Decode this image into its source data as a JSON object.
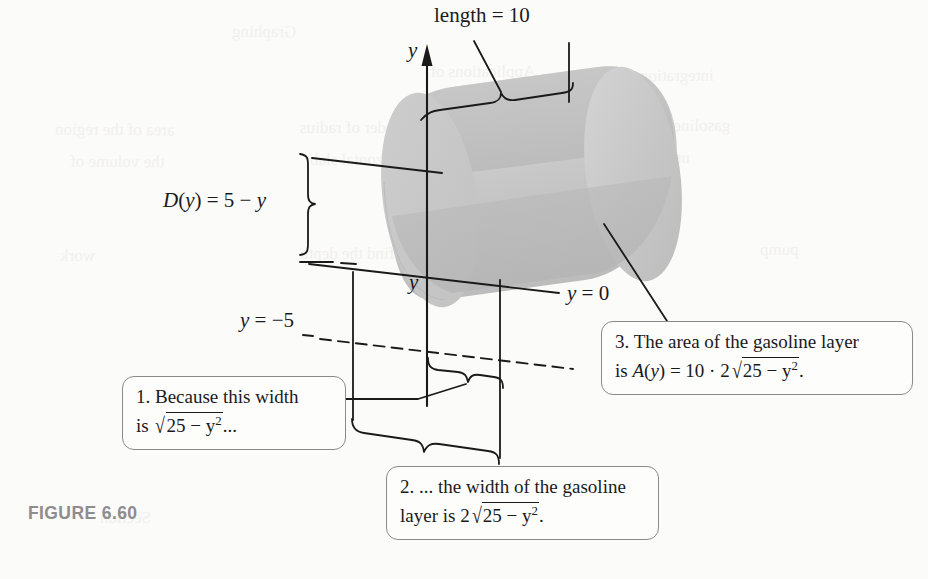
{
  "figure": {
    "caption": "FIGURE 6.60",
    "background_color": "#fbfbfa",
    "ink_color": "#1a1a1a",
    "caption_color": "#8d8d8d",
    "cylinder_body_color": "#c9c9c9",
    "cylinder_shadow_color": "#b0b0b0",
    "cylinder_highlight_color": "#d8d8d8",
    "callout_border_color": "#8a8a8a"
  },
  "labels": {
    "length": "length = 10",
    "axis_y": "y",
    "depth_function": "D(y) = 5 − y",
    "slab_y": "y",
    "y_zero": "y = 0",
    "y_minus_five": "y = −5"
  },
  "label_parts": {
    "length_text": "length = 10",
    "depth_lhs": "D",
    "depth_var": "y",
    "depth_rhs": "= 5 −",
    "depth_tail": "y",
    "y_zero_var": "y",
    "y_zero_rhs": "= 0",
    "y_minus_five_var": "y",
    "y_minus_five_rhs": "= −5"
  },
  "callouts": [
    {
      "id": "callout-1",
      "number": "1.",
      "line1_text": "Because this width",
      "line2_lead": "is",
      "line2_radicand": "25 − y",
      "line2_exponent": "2",
      "line2_tail": "...",
      "full_text": "1. Because this width is √25 − y²..."
    },
    {
      "id": "callout-2",
      "number": "2.",
      "line1_text": "... the width of the gasoline",
      "line2_lead": "layer is 2",
      "line2_radicand": "25 − y",
      "line2_exponent": "2",
      "line2_tail": ".",
      "full_text": "2. ... the width of the gasoline layer is 2√25 − y²."
    },
    {
      "id": "callout-3",
      "number": "3.",
      "line1_text": "The area of the gasoline layer",
      "line2_lead": "is A(y) = 10 · 2",
      "line2_radicand": "25 − y",
      "line2_exponent": "2",
      "line2_tail": ".",
      "full_text": "3. The area of the gasoline layer is A(y) = 10 · 2√25 − y²."
    }
  ],
  "ghost_marks": [
    {
      "text": "Graphing",
      "x": 232,
      "y": 22
    },
    {
      "text": "Applications of",
      "x": 430,
      "y": 62
    },
    {
      "text": "integration",
      "x": 640,
      "y": 66
    },
    {
      "text": "area of the region",
      "x": 55,
      "y": 120
    },
    {
      "text": "cylinder of radius",
      "x": 300,
      "y": 118
    },
    {
      "text": "gasoline tank",
      "x": 640,
      "y": 116
    },
    {
      "text": "the volume of",
      "x": 70,
      "y": 152
    },
    {
      "text": "horizontal slab",
      "x": 310,
      "y": 150
    },
    {
      "text": "use the result",
      "x": 600,
      "y": 148
    },
    {
      "text": "work",
      "x": 60,
      "y": 246
    },
    {
      "text": "find the depth",
      "x": 300,
      "y": 244
    },
    {
      "text": "pump",
      "x": 760,
      "y": 240
    },
    {
      "text": "EXERCISES",
      "x": 470,
      "y": 506
    },
    {
      "text": "Section",
      "x": 100,
      "y": 508
    }
  ]
}
